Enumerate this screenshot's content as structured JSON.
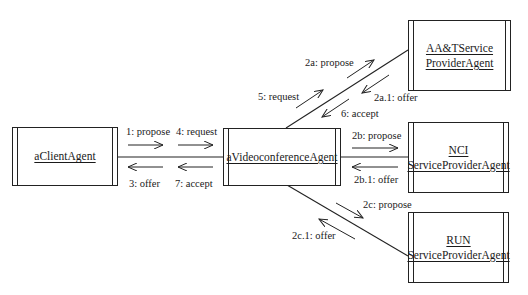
{
  "diagram": {
    "type": "UML collaboration diagram",
    "colors": {
      "line": "#222222",
      "text": "#1a1a1a",
      "background": "#ffffff"
    },
    "objects": [
      {
        "id": "client",
        "lines": [
          "aClientAgent"
        ]
      },
      {
        "id": "video",
        "lines": [
          "aVideoconferenceAgent"
        ]
      },
      {
        "id": "aat",
        "lines": [
          "AA&TService",
          "ProviderAgent"
        ]
      },
      {
        "id": "nci",
        "lines": [
          "NCI",
          "ServiceProviderAgent"
        ]
      },
      {
        "id": "run",
        "lines": [
          "RUN",
          "ServiceProviderAgent"
        ]
      }
    ],
    "links": [
      {
        "from": "client",
        "to": "video"
      },
      {
        "from": "video",
        "to": "aat"
      },
      {
        "from": "video",
        "to": "nci"
      },
      {
        "from": "video",
        "to": "run"
      }
    ],
    "messages": {
      "m1": "1: propose",
      "m4": "4: request",
      "m3": "3: offer",
      "m7": "7: accept",
      "m5": "5: request",
      "m6": "6: accept",
      "m2a": "2a: propose",
      "m2a1": "2a.1: offer",
      "m2b": "2b: propose",
      "m2b1": "2b.1: offer",
      "m2c": "2c: propose",
      "m2c1": "2c.1: offer"
    }
  }
}
